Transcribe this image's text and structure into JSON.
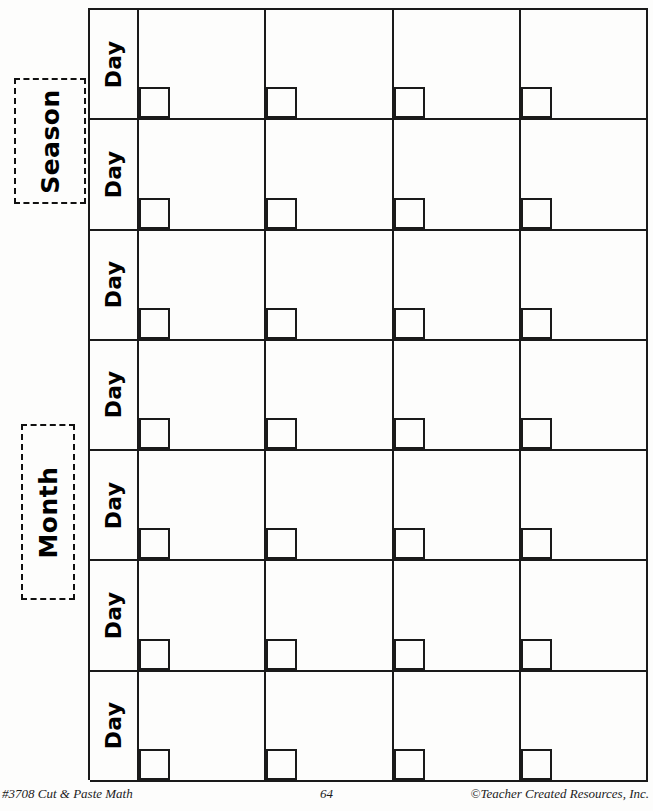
{
  "worksheet": {
    "title": "Cut & Paste Math Calendar Grid",
    "cut_labels": [
      {
        "name": "season",
        "text": "Season"
      },
      {
        "name": "month",
        "text": "Month"
      }
    ],
    "grid": {
      "row_label": "Day",
      "rows": 7,
      "columns": 4,
      "rows_data": [
        {
          "label": "Day",
          "cells": [
            "",
            "",
            "",
            ""
          ]
        },
        {
          "label": "Day",
          "cells": [
            "",
            "",
            "",
            ""
          ]
        },
        {
          "label": "Day",
          "cells": [
            "",
            "",
            "",
            ""
          ]
        },
        {
          "label": "Day",
          "cells": [
            "",
            "",
            "",
            ""
          ]
        },
        {
          "label": "Day",
          "cells": [
            "",
            "",
            "",
            ""
          ]
        },
        {
          "label": "Day",
          "cells": [
            "",
            "",
            "",
            ""
          ]
        },
        {
          "label": "Day",
          "cells": [
            "",
            "",
            "",
            ""
          ]
        }
      ]
    },
    "colors": {
      "ink": "#1a1a1a",
      "paper": "#fdfdfc",
      "dashed_border": "#111111"
    }
  },
  "footer": {
    "left": "#3708 Cut & Paste Math",
    "page_number": "64",
    "right": "©Teacher Created Resources, Inc."
  }
}
